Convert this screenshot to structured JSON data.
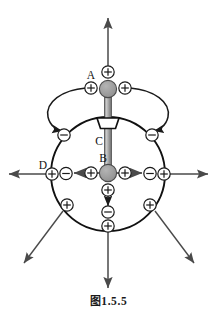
{
  "figure": {
    "caption_cjk": "图",
    "caption_number": "1.5.5",
    "caption_full": "图 1.5.5",
    "labels": {
      "A": "A",
      "B": "B",
      "C": "C",
      "D": "D"
    },
    "charge_symbols": {
      "positive": "+",
      "negative": "−"
    },
    "colors": {
      "stroke": "#1a1a1a",
      "sphere_fill": "#9a9a9a",
      "rod_fill": "#b3b3b3",
      "background": "#ffffff",
      "arrow_gray": "#5a5a5a"
    },
    "elements": {
      "outer_circle": {
        "cx": 108,
        "cy": 174,
        "r": 57
      },
      "sphere_A": {
        "cx": 108,
        "cy": 89,
        "r": 8.5,
        "label": "A"
      },
      "sphere_B": {
        "cx": 108,
        "cy": 173,
        "r": 8.5,
        "label": "B"
      },
      "rod": {
        "label": "C",
        "x1": 108,
        "y1": 89,
        "x2": 108,
        "y2": 173
      },
      "funnel": {
        "label": "C-collar",
        "cx": 108,
        "cy": 122
      }
    },
    "charges": [
      {
        "id": "q-top-apex",
        "sign": "+",
        "x": 108,
        "y": 72
      },
      {
        "id": "q-A-left",
        "sign": "+",
        "x": 91,
        "y": 88
      },
      {
        "id": "q-A-right",
        "sign": "+",
        "x": 125,
        "y": 88
      },
      {
        "id": "q-circle-upper-left",
        "sign": "−",
        "x": 65,
        "y": 134
      },
      {
        "id": "q-circle-upper-right",
        "sign": "−",
        "x": 151,
        "y": 134
      },
      {
        "id": "q-inner-left",
        "sign": "+",
        "x": 91,
        "y": 173
      },
      {
        "id": "q-inner-right",
        "sign": "+",
        "x": 125,
        "y": 173
      },
      {
        "id": "q-circle-left",
        "sign": "−",
        "x": 66,
        "y": 173
      },
      {
        "id": "q-circle-right",
        "sign": "−",
        "x": 150,
        "y": 173
      },
      {
        "id": "q-outer-left",
        "sign": "+",
        "x": 52,
        "y": 174,
        "label": "D"
      },
      {
        "id": "q-outer-right",
        "sign": "+",
        "x": 164,
        "y": 174
      },
      {
        "id": "q-inner-bottom",
        "sign": "+",
        "x": 108,
        "y": 190
      },
      {
        "id": "q-circle-bottom",
        "sign": "−",
        "x": 108,
        "y": 212
      },
      {
        "id": "q-outer-bottom",
        "sign": "+",
        "x": 108,
        "y": 226
      },
      {
        "id": "q-circle-lower-left",
        "sign": "+",
        "x": 67,
        "y": 205
      },
      {
        "id": "q-circle-lower-right",
        "sign": "+",
        "x": 150,
        "y": 205
      }
    ],
    "field_arrows": [
      {
        "id": "arrow-up",
        "direction": "up"
      },
      {
        "id": "arrow-left",
        "direction": "left"
      },
      {
        "id": "arrow-right",
        "direction": "right"
      },
      {
        "id": "arrow-down",
        "direction": "down"
      },
      {
        "id": "arrow-down-left",
        "direction": "down-left"
      },
      {
        "id": "arrow-down-right",
        "direction": "down-right"
      },
      {
        "id": "arrow-inner-left",
        "direction": "left"
      },
      {
        "id": "arrow-inner-right",
        "direction": "right"
      },
      {
        "id": "arrow-inner-down",
        "direction": "down"
      },
      {
        "id": "curve-left",
        "direction": "curved-left-down"
      },
      {
        "id": "curve-right",
        "direction": "curved-right-down"
      }
    ]
  }
}
